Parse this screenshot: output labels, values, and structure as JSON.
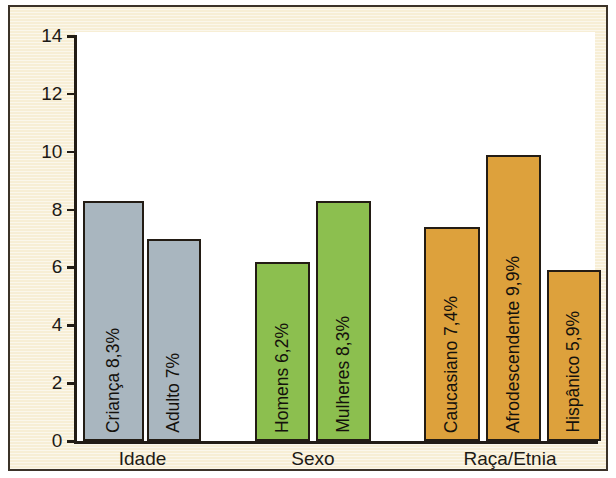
{
  "chart_data": {
    "type": "bar",
    "title": "",
    "subtitle": "",
    "xlabel": "",
    "ylabel": "",
    "ylim": [
      0,
      14
    ],
    "yticks": [
      0,
      2,
      4,
      6,
      8,
      10,
      12,
      14
    ],
    "ytick_labels": [
      "0",
      "2",
      "4",
      "6",
      "8",
      "10",
      "12",
      "14"
    ],
    "grid": false,
    "legend": "none",
    "groups": [
      {
        "name": "Idade",
        "color": "#a9b6bf",
        "bars": [
          {
            "label": "Criança 8,3%",
            "category": "Criança",
            "value": 8.3
          },
          {
            "label": "Adulto 7%",
            "category": "Adulto",
            "value": 7.0
          }
        ]
      },
      {
        "name": "Sexo",
        "color": "#8cbf4f",
        "bars": [
          {
            "label": "Homens 6,2%",
            "category": "Homens",
            "value": 6.2
          },
          {
            "label": "Mulheres 8,3%",
            "category": "Mulheres",
            "value": 8.3
          }
        ]
      },
      {
        "name": "Raça/Etnia",
        "color": "#dda13c",
        "bars": [
          {
            "label": "Caucasiano 7,4%",
            "category": "Caucasiano",
            "value": 7.4
          },
          {
            "label": "Afrodescendente 9,9%",
            "category": "Afrodescendente",
            "value": 9.9
          },
          {
            "label": "Hispânico 5,9%",
            "category": "Hispânico",
            "value": 5.9
          }
        ]
      }
    ],
    "categories": [
      "Criança",
      "Adulto",
      "Homens",
      "Mulheres",
      "Caucasiano",
      "Afrodescendente",
      "Hispânico"
    ],
    "values": [
      8.3,
      7.0,
      6.2,
      8.3,
      7.4,
      9.9,
      5.9
    ],
    "colors": {
      "idade": "#a9b6bf",
      "sexo": "#8cbf4f",
      "raca_etnia": "#dda13c",
      "background": "#f7eed5",
      "plot_background": "#ffffff",
      "axis": "#221c15",
      "bar_outline": "#231c14",
      "border": "#3b3228"
    }
  }
}
